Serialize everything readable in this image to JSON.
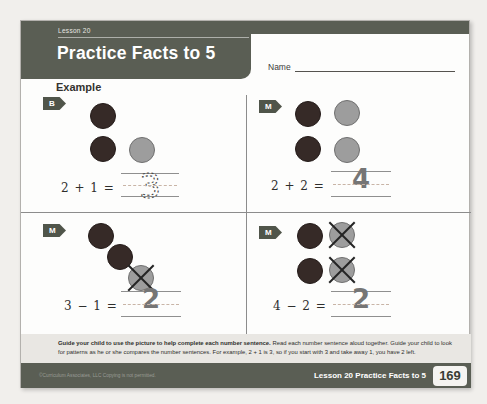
{
  "header": {
    "lesson_label": "Lesson 20",
    "title": "Practice Facts to 5",
    "name_label": "Name"
  },
  "example_label": "Example",
  "problems": [
    {
      "badge": "B",
      "equation": "2 + 1 =",
      "answer": "3",
      "answer_style": "dotted-traceable",
      "counters": {
        "dark": 2,
        "gray": 1,
        "crossed_out": 0
      }
    },
    {
      "badge": "M",
      "equation": "2 + 2 =",
      "answer": "4",
      "answer_style": "handwritten",
      "counters": {
        "dark": 2,
        "gray": 2,
        "crossed_out": 0
      }
    },
    {
      "badge": "M",
      "equation": "3 − 1 =",
      "answer": "2",
      "answer_style": "handwritten",
      "counters": {
        "dark": 2,
        "gray": 1,
        "crossed_out": 1
      }
    },
    {
      "badge": "M",
      "equation": "4 − 2 =",
      "answer": "2",
      "answer_style": "handwritten",
      "counters": {
        "dark": 2,
        "gray": 2,
        "crossed_out": 2
      }
    }
  ],
  "guide": {
    "lead": "Guide your child to use the picture to help complete each number sentence.",
    "body": "Read each number sentence aloud together. Guide your child to look for patterns as he or she compares the number sentences. For example, 2 + 1 is 3, so if you start with 3 and take away 1, you have 2 left."
  },
  "footer": {
    "copyright": "©Curriculum Associates, LLC   Copying is not permitted.",
    "lesson_ref": "Lesson 20 Practice Facts to 5",
    "page_number": "169"
  },
  "colors": {
    "banner": "#5a5e54",
    "footer_bar": "#5a5e54",
    "badge": "#50554a",
    "counter_dark": "#362a27",
    "counter_gray": "#9d9d9d",
    "guide_band": "#e9e7e3",
    "page_bg": "#fdfdfc"
  }
}
